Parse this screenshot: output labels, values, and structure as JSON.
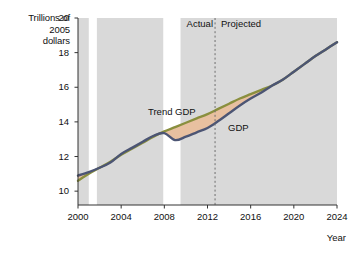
{
  "figure": {
    "ylabel": "Trillions of\n2005\ndollars",
    "xlabel": "Year",
    "annotations": {
      "actual": "Actual",
      "projected": "Projected",
      "trend_gdp": "Trend GDP",
      "gdp": "GDP"
    }
  },
  "chart_data": {
    "type": "line",
    "title": "",
    "xlabel": "Year",
    "ylabel": "Trillions of 2005 dollars",
    "xlim": [
      2000,
      2024
    ],
    "ylim": [
      9.2,
      20
    ],
    "xticks": [
      2000,
      2004,
      2008,
      2012,
      2016,
      2020,
      2024
    ],
    "yticks": [
      10,
      12,
      14,
      16,
      18,
      20
    ],
    "grid": false,
    "legend": "inline-annotations",
    "divider": {
      "label_left": "Actual",
      "label_right": "Projected",
      "x": 2012.7,
      "style": "dashed"
    },
    "recession_bands": [
      {
        "start": 2001.0,
        "end": 2001.75
      },
      {
        "start": 2007.9,
        "end": 2009.5
      }
    ],
    "plot_background": "#d9d9d9",
    "series": [
      {
        "name": "Trend GDP",
        "color": "#8a8f3e",
        "x": [
          2000,
          2001,
          2002,
          2003,
          2004,
          2005,
          2006,
          2007,
          2008,
          2009,
          2010,
          2011,
          2012,
          2013,
          2014,
          2015,
          2016,
          2017,
          2018,
          2019,
          2020,
          2021,
          2022,
          2023,
          2024
        ],
        "values": [
          10.6,
          11.0,
          11.35,
          11.7,
          12.1,
          12.45,
          12.8,
          13.15,
          13.45,
          13.7,
          13.95,
          14.2,
          14.45,
          14.75,
          15.05,
          15.35,
          15.6,
          15.85,
          16.1,
          16.45,
          16.9,
          17.35,
          17.8,
          18.2,
          18.6
        ]
      },
      {
        "name": "GDP",
        "color": "#4c5574",
        "x": [
          2000,
          2001,
          2002,
          2003,
          2004,
          2005,
          2006,
          2007,
          2008,
          2009,
          2010,
          2011,
          2012,
          2013,
          2014,
          2015,
          2016,
          2017,
          2018,
          2019,
          2020,
          2021,
          2022,
          2023,
          2024
        ],
        "values": [
          10.9,
          11.1,
          11.35,
          11.65,
          12.15,
          12.5,
          12.85,
          13.2,
          13.35,
          12.95,
          13.15,
          13.4,
          13.65,
          14.05,
          14.5,
          14.95,
          15.35,
          15.7,
          16.1,
          16.45,
          16.9,
          17.35,
          17.8,
          18.2,
          18.6
        ]
      }
    ],
    "gap_fill": {
      "name": "Output gap",
      "color": "#e8c0a0",
      "between": [
        "Trend GDP",
        "GDP"
      ]
    }
  }
}
